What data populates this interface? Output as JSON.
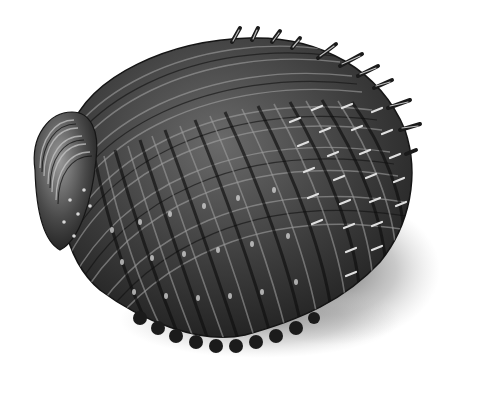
{
  "scene": {
    "subject": "spiny cockle shell engraving",
    "colors": {
      "background": "#ffffff",
      "shell_dark": "#1e1e1e",
      "shell_mid": "#4a4a4a",
      "shell_light": "#8a8a8a",
      "highlight": "#d8d8d8",
      "shadow": "#6e6e6e"
    }
  }
}
